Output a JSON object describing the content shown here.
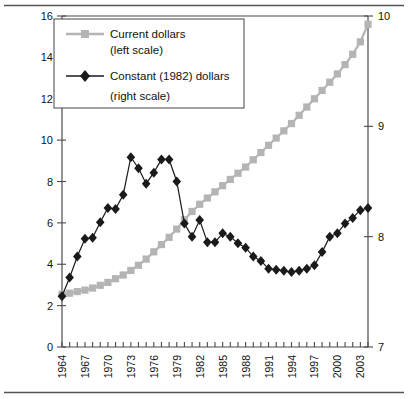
{
  "chart_data": {
    "type": "line",
    "title": "",
    "subtitle": "",
    "xlabel": "",
    "ylabel": "",
    "grid": false,
    "legend_position": "top-left",
    "x": [
      1964,
      1965,
      1966,
      1967,
      1968,
      1969,
      1970,
      1971,
      1972,
      1973,
      1974,
      1975,
      1976,
      1977,
      1978,
      1979,
      1980,
      1981,
      1982,
      1983,
      1984,
      1985,
      1986,
      1987,
      1988,
      1989,
      1990,
      1991,
      1992,
      1993,
      1994,
      1995,
      1996,
      1997,
      1998,
      1999,
      2000,
      2001,
      2002,
      2003,
      2004
    ],
    "x_tick_labels": [
      "1964",
      "1967",
      "1970",
      "1973",
      "1976",
      "1979",
      "1982",
      "1985",
      "1988",
      "1991",
      "1994",
      "1997",
      "2000",
      "2003"
    ],
    "x_tick_values": [
      1964,
      1967,
      1970,
      1973,
      1976,
      1979,
      1982,
      1985,
      1988,
      1991,
      1994,
      1997,
      2000,
      2003
    ],
    "left_axis": {
      "name": "Current dollars (left scale)",
      "ylim": [
        0,
        16
      ],
      "ticks": [
        0,
        2,
        4,
        6,
        8,
        10,
        12,
        14,
        16
      ],
      "tick_labels": [
        "0",
        "2",
        "4",
        "6",
        "8",
        "10",
        "12",
        "14",
        "16"
      ]
    },
    "right_axis": {
      "name": "Constant (1982) dollars (right scale)",
      "ylim": [
        7,
        10
      ],
      "ticks": [
        7,
        8,
        9,
        10
      ],
      "tick_labels": [
        "7",
        "8",
        "9",
        "10"
      ]
    },
    "series": [
      {
        "name": "Current dollars",
        "axis": "left",
        "marker": "square",
        "color": "#b4b4b4",
        "values": [
          2.55,
          2.6,
          2.68,
          2.75,
          2.85,
          2.98,
          3.12,
          3.3,
          3.48,
          3.7,
          3.95,
          4.25,
          4.6,
          4.95,
          5.3,
          5.7,
          6.15,
          6.55,
          6.9,
          7.2,
          7.5,
          7.8,
          8.1,
          8.4,
          8.7,
          9.05,
          9.4,
          9.75,
          10.1,
          10.45,
          10.8,
          11.2,
          11.6,
          12.0,
          12.4,
          12.8,
          13.2,
          13.65,
          14.15,
          14.75,
          15.6
        ]
      },
      {
        "name": "Constant (1982) dollars",
        "axis": "right",
        "marker": "diamond",
        "color": "#1a1a1a",
        "values": [
          7.46,
          7.63,
          7.82,
          7.98,
          7.99,
          8.13,
          8.26,
          8.25,
          8.38,
          8.72,
          8.62,
          8.48,
          8.58,
          8.7,
          8.7,
          8.5,
          8.12,
          8.0,
          8.15,
          7.95,
          7.95,
          8.03,
          8.0,
          7.94,
          7.9,
          7.82,
          7.78,
          7.71,
          7.7,
          7.69,
          7.68,
          7.69,
          7.71,
          7.74,
          7.86,
          8.0,
          8.03,
          8.12,
          8.17,
          8.24,
          8.26
        ]
      }
    ],
    "note_current_dollars_readable": "Current-dollar series rises smoothly from about 2.5 in 1964 to about 15.6 in 2004.",
    "note_constant_dollars_readable": "Constant-1982-dollar series rises to a peak near 8.7 around 1973, dips, peaks again near 8.7 in 1978, falls to a trough near 7.68 in the mid-1990s, then recovers to about 8.26 by 2004."
  },
  "legend": {
    "entries": [
      {
        "label": "Current dollars",
        "sublabel": "(left scale)",
        "marker": "square-marker",
        "color": "#b4b4b4"
      },
      {
        "label": "Constant (1982) dollars",
        "sublabel": "(right scale)",
        "marker": "diamond-marker",
        "color": "#1a1a1a"
      }
    ]
  }
}
